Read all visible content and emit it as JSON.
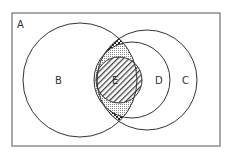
{
  "diagram": {
    "type": "venn",
    "universe": {
      "label": "A"
    },
    "sets": [
      {
        "id": "B",
        "label": "B"
      },
      {
        "id": "C",
        "label": "C"
      },
      {
        "id": "D",
        "label": "D",
        "subset_of": "C"
      },
      {
        "id": "E",
        "label": "E",
        "subset_of": "D"
      }
    ],
    "shaded_regions": [
      {
        "region": "B ∩ C minus D",
        "pattern": "crosshatch-dark"
      },
      {
        "region": "B ∩ D minus E",
        "pattern": "fine-dots"
      },
      {
        "region": "E",
        "pattern": "diagonal-hatch"
      }
    ],
    "colors": {
      "stroke": "#333333",
      "background": "#ffffff"
    }
  }
}
